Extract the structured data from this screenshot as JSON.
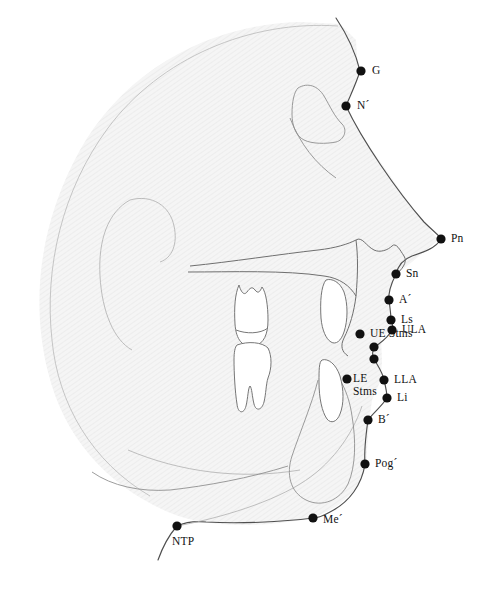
{
  "figure": {
    "type": "lateral cephalogram tracing",
    "background_color": "#ffffff",
    "skull_fill_color": "#f2f2f2",
    "outline_stroke_color": "#6e6e6e",
    "profile_stroke_color": "#4a4a4a",
    "landmark_dot_color": "#111111",
    "label_text_color": "#111111"
  },
  "landmarks": [
    {
      "id": "G",
      "label": "G",
      "name": "glabella",
      "dot": {
        "x": 361,
        "y": 71,
        "r": 4.6
      },
      "label_pos": {
        "x": 372,
        "y": 64
      },
      "lines": [
        "G"
      ]
    },
    {
      "id": "N",
      "label": "N´",
      "name": "soft-tissue-nasion",
      "dot": {
        "x": 346,
        "y": 106,
        "r": 4.6
      },
      "label_pos": {
        "x": 357,
        "y": 99
      },
      "lines": [
        "N´"
      ]
    },
    {
      "id": "Pn",
      "label": "Pn",
      "name": "pronasale",
      "dot": {
        "x": 441,
        "y": 239,
        "r": 4.6
      },
      "label_pos": {
        "x": 451,
        "y": 232
      },
      "lines": [
        "Pn"
      ]
    },
    {
      "id": "Sn",
      "label": "Sn",
      "name": "subnasale",
      "dot": {
        "x": 396,
        "y": 274,
        "r": 4.6
      },
      "label_pos": {
        "x": 406,
        "y": 267
      },
      "lines": [
        "Sn"
      ]
    },
    {
      "id": "A",
      "label": "A´",
      "name": "soft-tissue-a-point",
      "dot": {
        "x": 389,
        "y": 300,
        "r": 4.6
      },
      "label_pos": {
        "x": 399,
        "y": 293
      },
      "lines": [
        "A´"
      ]
    },
    {
      "id": "Ls",
      "label": "Ls",
      "name": "labrale-superius",
      "dot": {
        "x": 391,
        "y": 320,
        "r": 4.6
      },
      "label_pos": {
        "x": 401,
        "y": 313
      },
      "lines": [
        "Ls"
      ]
    },
    {
      "id": "ULA",
      "label": "ULA",
      "name": "upper-lip-anterior",
      "dot": {
        "x": 392,
        "y": 330,
        "r": 4.6
      },
      "label_pos": {
        "x": 402,
        "y": 323
      },
      "lines": [
        "ULA"
      ]
    },
    {
      "id": "UEStms",
      "label": "UE Stms",
      "name": "upper-embrasure-stomion-superius",
      "dot": {
        "x": 360,
        "y": 334,
        "r": 4.6
      },
      "label_pos": {
        "x": 370,
        "y": 327
      },
      "lines": [
        "UE Stms"
      ]
    },
    {
      "id": "unlabeled1",
      "label": "",
      "name": "stomion-upper-unlabeled",
      "dot": {
        "x": 374,
        "y": 347,
        "r": 4.6
      },
      "label_pos": null,
      "lines": []
    },
    {
      "id": "unlabeled2",
      "label": "",
      "name": "stomion-lower-unlabeled",
      "dot": {
        "x": 374,
        "y": 359,
        "r": 4.6
      },
      "label_pos": null,
      "lines": []
    },
    {
      "id": "LEStms",
      "label": "LE\nStms",
      "name": "lower-embrasure-stomion-inferius",
      "dot": {
        "x": 347,
        "y": 379,
        "r": 4.6
      },
      "label_pos": {
        "x": 353,
        "y": 372
      },
      "lines": [
        "LE",
        "Stms"
      ]
    },
    {
      "id": "LLA",
      "label": "LLA",
      "name": "lower-lip-anterior",
      "dot": {
        "x": 384,
        "y": 380,
        "r": 4.6
      },
      "label_pos": {
        "x": 394,
        "y": 373
      },
      "lines": [
        "LLA"
      ]
    },
    {
      "id": "Li",
      "label": "Li",
      "name": "labrale-inferius",
      "dot": {
        "x": 387,
        "y": 398,
        "r": 4.6
      },
      "label_pos": {
        "x": 397,
        "y": 391
      },
      "lines": [
        "Li"
      ]
    },
    {
      "id": "B",
      "label": "B´",
      "name": "soft-tissue-b-point",
      "dot": {
        "x": 368,
        "y": 420,
        "r": 4.6
      },
      "label_pos": {
        "x": 378,
        "y": 413
      },
      "lines": [
        "B´"
      ]
    },
    {
      "id": "Pog",
      "label": "Pog´",
      "name": "soft-tissue-pogonion",
      "dot": {
        "x": 365,
        "y": 464,
        "r": 4.6
      },
      "label_pos": {
        "x": 375,
        "y": 457
      },
      "lines": [
        "Pog´"
      ]
    },
    {
      "id": "Me",
      "label": "Me´",
      "name": "soft-tissue-menton",
      "dot": {
        "x": 313,
        "y": 518,
        "r": 4.6
      },
      "label_pos": {
        "x": 323,
        "y": 513
      },
      "lines": [
        "Me´"
      ]
    },
    {
      "id": "NTP",
      "label": "NTP",
      "name": "neck-throat-point",
      "dot": {
        "x": 177,
        "y": 526,
        "r": 4.6
      },
      "label_pos": {
        "x": 172,
        "y": 535
      },
      "lines": [
        "NTP"
      ]
    }
  ]
}
